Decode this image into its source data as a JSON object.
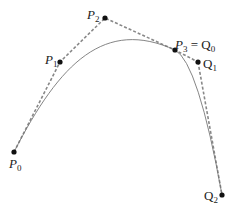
{
  "diagram": {
    "points": [
      {
        "id": "P0",
        "label": "P",
        "sub": "0",
        "x": 14,
        "y": 152,
        "lx": 9,
        "ly": 168,
        "italic": true
      },
      {
        "id": "P1",
        "label": "P",
        "sub": "1",
        "x": 60,
        "y": 62,
        "lx": 45,
        "ly": 64,
        "italic": true
      },
      {
        "id": "P2",
        "label": "P",
        "sub": "2",
        "x": 105,
        "y": 18,
        "lx": 87,
        "ly": 19,
        "italic": true
      },
      {
        "id": "P3",
        "label": "P",
        "sub": "3",
        "x": 175,
        "y": 50,
        "lx": 175,
        "ly": 49,
        "italic": true,
        "suffix": " = Q",
        "suffix_sub": "0"
      },
      {
        "id": "Q1",
        "label": "Q",
        "sub": "1",
        "x": 198,
        "y": 62,
        "lx": 203,
        "ly": 68,
        "italic": false
      },
      {
        "id": "Q2",
        "label": "Q",
        "sub": "2",
        "x": 222,
        "y": 195,
        "lx": 204,
        "ly": 200,
        "italic": false
      }
    ],
    "colors": {
      "curve": "#777777",
      "control": "#888888",
      "point": "#111111"
    }
  }
}
